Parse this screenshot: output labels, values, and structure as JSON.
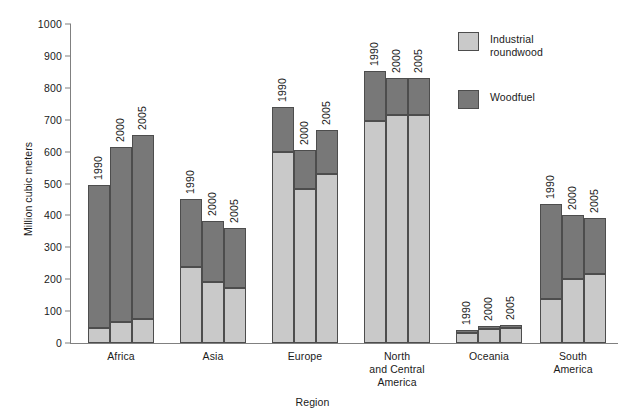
{
  "chart_data": {
    "type": "bar",
    "subtype": "stacked-grouped",
    "title": "",
    "xlabel": "Region",
    "ylabel": "Million cubic meters",
    "ylim": [
      0,
      1000
    ],
    "ytick_step": 100,
    "yticks": [
      0,
      100,
      200,
      300,
      400,
      500,
      600,
      700,
      800,
      900,
      1000
    ],
    "grid": false,
    "legend_position": "top-right",
    "categories": [
      "Africa",
      "Asia",
      "Europe",
      "North and Central America",
      "Oceania",
      "South America"
    ],
    "group_labels": [
      "1990",
      "2000",
      "2005"
    ],
    "series": [
      {
        "name": "Industrial roundwood",
        "color": "#c9c9c9",
        "values": [
          [
            48,
            67,
            75
          ],
          [
            238,
            190,
            172
          ],
          [
            600,
            483,
            530
          ],
          [
            697,
            715,
            715
          ],
          [
            31,
            44,
            48
          ],
          [
            137,
            200,
            217
          ]
        ]
      },
      {
        "name": "Woodfuel",
        "color": "#787878",
        "values": [
          [
            447,
            546,
            578
          ],
          [
            214,
            194,
            189
          ],
          [
            140,
            122,
            137
          ],
          [
            155,
            117,
            115
          ],
          [
            10,
            9,
            10
          ],
          [
            300,
            200,
            175
          ]
        ]
      }
    ],
    "totals": [
      [
        495,
        613,
        653
      ],
      [
        452,
        384,
        361
      ],
      [
        740,
        605,
        667
      ],
      [
        852,
        832,
        830
      ],
      [
        41,
        53,
        58
      ],
      [
        437,
        400,
        392
      ]
    ]
  },
  "legend": {
    "items": [
      {
        "label": "Industrial\nroundwood",
        "color": "#c9c9c9"
      },
      {
        "label": "Woodfuel",
        "color": "#787878"
      }
    ]
  },
  "axes": {
    "y_title": "Million cubic meters",
    "x_title": "Region",
    "y_tick_labels": [
      "1000",
      "900",
      "800",
      "700",
      "600",
      "500",
      "400",
      "300",
      "200",
      "100",
      "0"
    ],
    "x_tick_labels": [
      "Africa",
      "Asia",
      "Europe",
      "North\nand Central\nAmerica",
      "Oceania",
      "South\nAmerica"
    ]
  },
  "colors": {
    "industrial_roundwood": "#c9c9c9",
    "woodfuel": "#787878",
    "axis": "#808080",
    "bar_outline": "#4d4d4d",
    "background": "#ffffff"
  }
}
